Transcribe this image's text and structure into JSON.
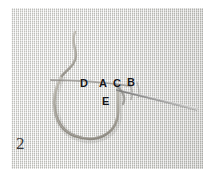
{
  "figure": {
    "kind": "instructional-photograph",
    "subject": "embroidery stitch demonstration on woven linen",
    "step_number": "2",
    "fabric_color": "#d4d4d1",
    "thread_color": "#9a968d",
    "needle_color": "#8c8c8c",
    "label_color": "#16161a"
  },
  "labels": [
    {
      "id": "label-d",
      "text": "D"
    },
    {
      "id": "label-a",
      "text": "A"
    },
    {
      "id": "label-c",
      "text": "C"
    },
    {
      "id": "label-b",
      "text": "B"
    },
    {
      "id": "label-e",
      "text": "E"
    }
  ],
  "elements": {
    "thread_tail": "thread-tail",
    "thread_loop": "thread-loop",
    "horizontal_stitch": "horizontal-stitch",
    "needle": "needle"
  }
}
